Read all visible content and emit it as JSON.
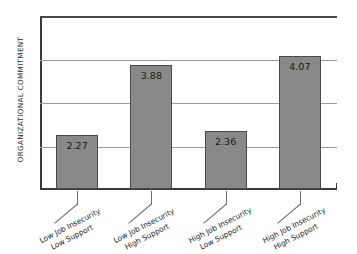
{
  "chart_data": {
    "type": "bar",
    "title": "",
    "xlabel": "",
    "ylabel": "ORGANIZATIONAL COMMITMENT",
    "categories": [
      "Low Job Insecurity Low Support",
      "Low Job Insecurity High Support",
      "High Job Insecurity Low Support",
      "High Job Insecurity High Support"
    ],
    "category_lines": [
      [
        "Low Job Insecurity",
        "Low Support"
      ],
      [
        "Low Job Insecurity",
        "High Support"
      ],
      [
        "High Job Insecurity",
        "Low Support"
      ],
      [
        "High Job Insecurity",
        "High Support"
      ]
    ],
    "values": [
      2.27,
      3.88,
      2.36,
      4.07
    ],
    "value_labels": [
      "2.27",
      "3.88",
      "2.36",
      "4.07"
    ],
    "ylim": [
      1,
      5
    ],
    "yticks": [
      1,
      2,
      3,
      4,
      5
    ],
    "ytick_labels": [
      "1",
      "2",
      "3",
      "4",
      "5"
    ],
    "grid": true,
    "grid_axis": "y",
    "legend": false,
    "bar_color": "#898989",
    "bar_border_color": "#4a4a4a",
    "grid_color": "#9a9a9a",
    "axis_color": "#3a3a3a",
    "background": "#ffffff"
  }
}
